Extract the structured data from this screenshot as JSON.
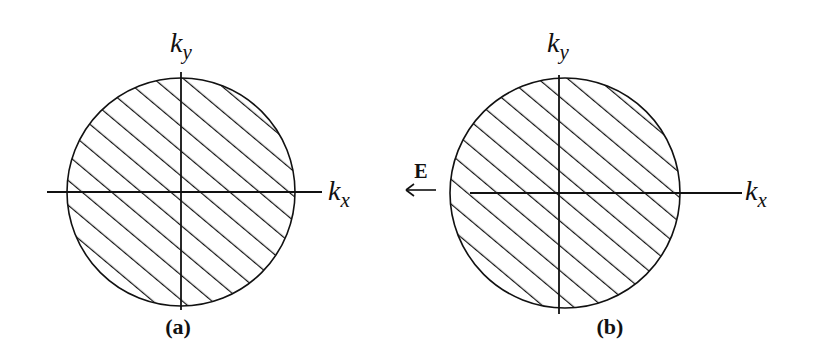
{
  "figure": {
    "panels": [
      {
        "id": "a",
        "caption": "(a)",
        "x_axis_label": "k",
        "x_axis_sub": "x",
        "y_axis_label": "k",
        "y_axis_sub": "y",
        "description": "Fermi disk centered at origin, fully hatched"
      },
      {
        "id": "b",
        "caption": "(b)",
        "x_axis_label": "k",
        "x_axis_sub": "x",
        "y_axis_label": "k",
        "y_axis_sub": "y",
        "description": "Fermi disk displaced along +kx, fully hatched"
      }
    ],
    "field": {
      "label": "E",
      "direction": "left"
    }
  },
  "colors": {
    "ink": "#111111",
    "background": "#ffffff"
  }
}
